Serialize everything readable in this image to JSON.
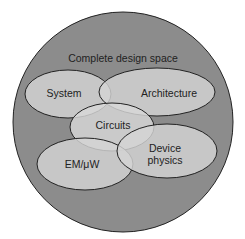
{
  "diagram": {
    "type": "venn",
    "outer": {
      "label": "Complete design space",
      "fill": "#8c8c8c"
    },
    "regions": [
      {
        "id": "system",
        "label": "System",
        "fill": "#d4d4d4"
      },
      {
        "id": "architecture",
        "label": "Architecture",
        "fill": "#d4d4d4"
      },
      {
        "id": "circuits",
        "label": "Circuits",
        "fill": "#d8d8d8"
      },
      {
        "id": "em-uw",
        "label": "EM/μW",
        "fill": "#d4d4d4"
      },
      {
        "id": "device-physics",
        "label_line1": "Device",
        "label_line2": "physics",
        "fill": "#d4d4d4"
      }
    ],
    "stroke": "#222222"
  }
}
